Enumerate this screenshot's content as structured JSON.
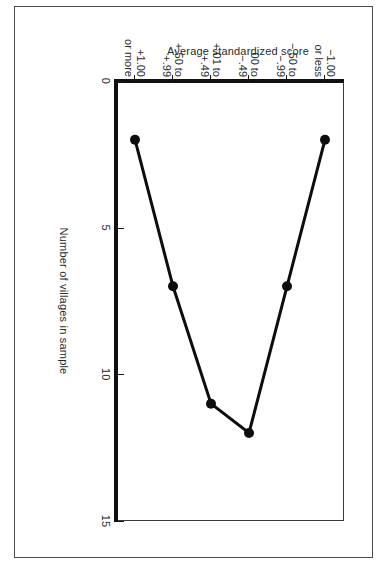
{
  "figure": {
    "orientation": "rotated-90",
    "frame_color": "#4a4a4a",
    "line_color": "#0d0d0d",
    "background": "#ffffff"
  },
  "chart_data": {
    "type": "line",
    "title": "",
    "xlabel": "Average standardized score",
    "ylabel": "Number of villages in sample",
    "categories": [
      "−1.00\nor less",
      "−.50 to\n−.99",
      ".00 to\n−.49",
      "+.01 to\n+.49",
      "+.50 to\n+.99",
      "+1.00\nor more"
    ],
    "values": [
      2,
      7,
      12,
      11,
      7,
      2
    ],
    "ylim": [
      0,
      15
    ],
    "yticks": [
      0,
      5,
      10,
      15
    ],
    "ytick_labels": [
      "0",
      "5",
      "10",
      "15"
    ],
    "grid": false,
    "legend": false,
    "marker": "filled-circle",
    "marker_size": 5
  }
}
